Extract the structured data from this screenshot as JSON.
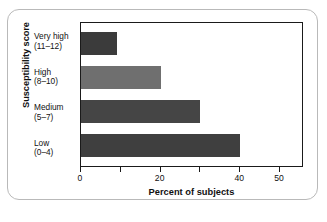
{
  "chart_data": {
    "type": "bar",
    "orientation": "horizontal",
    "title": "",
    "xlabel": "Percent of subjects",
    "ylabel": "Susceptibility score",
    "categories": [
      "Very high (11–12)",
      "High (8–10)",
      "Medium (5–7)",
      "Low (0–4)"
    ],
    "category_lines": [
      {
        "name": "Very high",
        "range": "(11–12)"
      },
      {
        "name": "High",
        "range": "(8–10)"
      },
      {
        "name": "Medium",
        "range": "(5–7)"
      },
      {
        "name": "Low",
        "range": "(0–4)"
      }
    ],
    "values": [
      9,
      20,
      30,
      40
    ],
    "bar_colors": [
      "#3b3b3b",
      "#6f6f6f",
      "#454545",
      "#3f3f3f"
    ],
    "xlim": [
      0,
      56
    ],
    "ylim": [
      0,
      4
    ],
    "xticks": [
      0,
      10,
      20,
      30,
      40,
      50
    ],
    "xtick_labels": [
      "0",
      "",
      "20",
      "",
      "40",
      "50"
    ],
    "grid": false,
    "legend": false
  },
  "axes": {
    "x_title": "Percent of subjects",
    "y_title": "Susceptibility score"
  },
  "frame": {
    "border_color": "#b9b9b9",
    "plot_border_color": "#1a1a1a"
  }
}
